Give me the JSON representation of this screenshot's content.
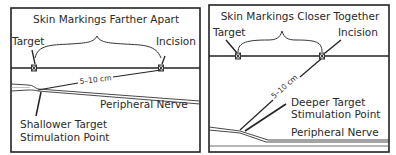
{
  "left_panel": {
    "title": "Skin Markings Farther Apart",
    "target_label": "Target",
    "incision_label": "Incision",
    "distance_label": "5–10 cm",
    "nerve_label": "Peripheral Nerve",
    "stim_label_line1": "Shallower Target",
    "stim_label_line2": "Stimulation Point"
  },
  "right_panel": {
    "title": "Skin Markings Closer Together",
    "target_label": "Target",
    "incision_label": "Incision",
    "distance_label": "5–10 cm",
    "nerve_label": "Peripheral Nerve",
    "stim_label_line1": "Deeper Target",
    "stim_label_line2": "Stimulation Point"
  },
  "colors": {
    "line": "#222222",
    "text": "#2a2a2a",
    "background": "#ffffff"
  }
}
